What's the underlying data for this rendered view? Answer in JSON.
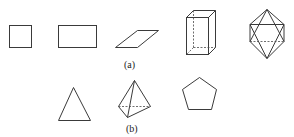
{
  "figure": {
    "rows": [
      {
        "label": "(a)",
        "shapes": [
          "square",
          "rectangle",
          "parallelogram",
          "rectangular-prism",
          "octahedron"
        ]
      },
      {
        "label": "(b)",
        "shapes": [
          "triangle",
          "tetrahedron",
          "pentagon"
        ]
      }
    ],
    "colors": {
      "line": "#3a3a3a",
      "background": "#ffffff"
    }
  }
}
